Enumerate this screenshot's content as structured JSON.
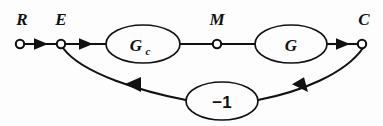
{
  "diagram": {
    "background_color": "#fdfdfd",
    "line_color": "#111111",
    "signal_labels": [
      {
        "id": "R",
        "text": "R",
        "x": 22,
        "y": 25
      },
      {
        "id": "E",
        "text": "E",
        "x": 61,
        "y": 25
      },
      {
        "id": "M",
        "text": "M",
        "x": 217,
        "y": 25
      },
      {
        "id": "C",
        "text": "C",
        "x": 364,
        "y": 25
      }
    ],
    "blocks": [
      {
        "id": "Gc",
        "label": "G",
        "subscript": "c",
        "cx": 143,
        "cy": 44,
        "rx": 37,
        "ry": 19
      },
      {
        "id": "G",
        "label": "G",
        "subscript": "",
        "cx": 291,
        "cy": 44,
        "rx": 36,
        "ry": 19
      },
      {
        "id": "gain",
        "label": "−1",
        "subscript": "",
        "cx": 222,
        "cy": 101,
        "rx": 36,
        "ry": 19
      }
    ],
    "nodes": [
      {
        "id": "R",
        "cx": 20,
        "cy": 44,
        "r": 4.2
      },
      {
        "id": "E",
        "cx": 61,
        "cy": 44,
        "r": 4.2
      },
      {
        "id": "M",
        "cx": 217,
        "cy": 44,
        "r": 4.2
      },
      {
        "id": "C",
        "cx": 362,
        "cy": 44,
        "r": 4.2
      }
    ],
    "edges": [
      {
        "id": "R-to-E",
        "from": "R",
        "to": "E",
        "arrow": true
      },
      {
        "id": "E-to-Gc",
        "from": "E",
        "to": "Gc",
        "arrow": true
      },
      {
        "id": "Gc-to-M",
        "from": "Gc",
        "to": "M",
        "arrow": false
      },
      {
        "id": "M-to-G",
        "from": "M",
        "to": "G",
        "arrow": false
      },
      {
        "id": "G-to-C",
        "from": "G",
        "to": "C",
        "arrow": true
      },
      {
        "id": "C-to-gain",
        "from": "C",
        "to": "gain",
        "arrow": true
      },
      {
        "id": "gain-to-E",
        "from": "gain",
        "to": "E",
        "arrow": true
      }
    ]
  }
}
